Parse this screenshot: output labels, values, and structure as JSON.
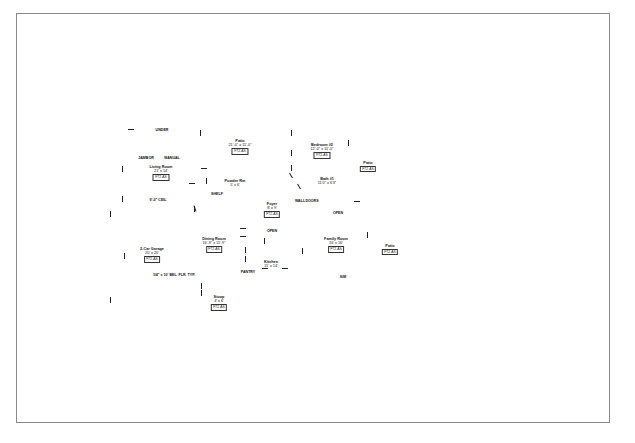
{
  "drawing": {
    "type": "floor-plan",
    "rooms": [
      {
        "name": "Patio",
        "dim": "21'-0\" x 11'-0\"",
        "area": "FT2-AS",
        "x": 240,
        "y": 139
      },
      {
        "name": "Bedroom #2",
        "dim": "12'-0\" x 11'-0\"",
        "area": "FT2-AS",
        "x": 322,
        "y": 143
      },
      {
        "name": "Patio",
        "dim": "",
        "area": "FT2-AS",
        "x": 368,
        "y": 161
      },
      {
        "name": "Living Room",
        "dim": "21' x 14'",
        "area": "FT2-AS",
        "x": 161,
        "y": 165
      },
      {
        "name": "Powder Rm",
        "dim": "5' x 6'",
        "area": "",
        "x": 235,
        "y": 179
      },
      {
        "name": "Bath #1",
        "dim": "11'0\" x 6'3\"",
        "area": "",
        "x": 327,
        "y": 177
      },
      {
        "name": "Foyer",
        "dim": "8' x 9'",
        "area": "FT2-AS",
        "x": 272,
        "y": 202
      },
      {
        "name": "Dining Room",
        "dim": "16'-9\" x 11'-9\"",
        "area": "FT2-AS",
        "x": 214,
        "y": 237
      },
      {
        "name": "Family Room",
        "dim": "16' x 16'",
        "area": "FT2-AS",
        "x": 336,
        "y": 237
      },
      {
        "name": "Patio",
        "dim": "",
        "area": "FT2-AS",
        "x": 390,
        "y": 244
      },
      {
        "name": "2-Car Garage",
        "dim": "20' x 20'",
        "area": "FT2-AS",
        "x": 152,
        "y": 247
      },
      {
        "name": "Kitchen",
        "dim": "11' x 14'",
        "area": "",
        "x": 271,
        "y": 260
      },
      {
        "name": "Stoop",
        "dim": "4' x 6'",
        "area": "FT2-AS",
        "x": 219,
        "y": 295
      }
    ],
    "annotations": [
      {
        "text": "UNDER",
        "x": 162,
        "y": 128
      },
      {
        "text": "JAMBOR",
        "x": 146,
        "y": 156
      },
      {
        "text": "MANUAL",
        "x": 172,
        "y": 156
      },
      {
        "text": "9'-0\" CEIL",
        "x": 158,
        "y": 198
      },
      {
        "text": "SHELF",
        "x": 217,
        "y": 192
      },
      {
        "text": "WALL",
        "x": 300,
        "y": 199
      },
      {
        "text": "DOORS",
        "x": 312,
        "y": 199
      },
      {
        "text": "OPEN",
        "x": 338,
        "y": 211
      },
      {
        "text": "OPEN",
        "x": 272,
        "y": 229
      },
      {
        "text": "PANTRY",
        "x": 248,
        "y": 270
      },
      {
        "text": "1/4\" x 10' BEL. FLR. TYP.",
        "x": 174,
        "y": 273
      },
      {
        "text": "SIM",
        "x": 343,
        "y": 275
      }
    ]
  }
}
